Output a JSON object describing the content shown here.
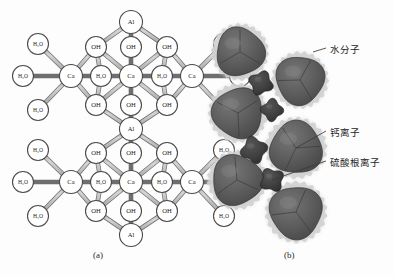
{
  "figure": {
    "background": "#fdfdfd",
    "panels": [
      {
        "id": "a",
        "caption": "(a)",
        "kind": "ball-and-stick-structure"
      },
      {
        "id": "b",
        "caption": "(b)",
        "kind": "space-filling-hydrated-ions"
      }
    ]
  },
  "panel_a": {
    "caption": "(a)",
    "node_colors": {
      "fill": "#ffffff",
      "stroke": "#4a4a4a",
      "bond": "#b9b9b9",
      "bond_edge": "#6e6e6e"
    },
    "node_labels": {
      "aluminium": "Al",
      "calcium": "Ca",
      "hydroxide": "OH",
      "water": "H₂O"
    },
    "nodes": [
      {
        "id": "al-top",
        "label": "Al",
        "x": 131,
        "y": 22,
        "r": 11.5
      },
      {
        "id": "oh-t-l",
        "label": "OH",
        "x": 96,
        "y": 47,
        "r": 10.5
      },
      {
        "id": "oh-t-c",
        "label": "OH",
        "x": 131,
        "y": 47,
        "r": 10.5
      },
      {
        "id": "oh-t-r",
        "label": "OH",
        "x": 167,
        "y": 47,
        "r": 10.5
      },
      {
        "id": "ca-l",
        "label": "Ca",
        "x": 71,
        "y": 76,
        "r": 11.5
      },
      {
        "id": "h2o-m-l",
        "label": "H₂O",
        "x": 101,
        "y": 76,
        "r": 10.5
      },
      {
        "id": "ca-c",
        "label": "Ca",
        "x": 131,
        "y": 76,
        "r": 11.5
      },
      {
        "id": "h2o-m-r",
        "label": "H₂O",
        "x": 162,
        "y": 76,
        "r": 10.5
      },
      {
        "id": "ca-r",
        "label": "Ca",
        "x": 192,
        "y": 76,
        "r": 11.5
      },
      {
        "id": "oh-b-l",
        "label": "OH",
        "x": 96,
        "y": 105,
        "r": 10.5
      },
      {
        "id": "oh-b-c",
        "label": "OH",
        "x": 131,
        "y": 105,
        "r": 10.5
      },
      {
        "id": "oh-b-r",
        "label": "OH",
        "x": 167,
        "y": 105,
        "r": 10.5
      },
      {
        "id": "al-mid",
        "label": "Al",
        "x": 131,
        "y": 129,
        "r": 11.5
      },
      {
        "id": "oh2-t-l",
        "label": "OH",
        "x": 96,
        "y": 153,
        "r": 10.5
      },
      {
        "id": "oh2-t-c",
        "label": "OH",
        "x": 131,
        "y": 153,
        "r": 10.5
      },
      {
        "id": "oh2-t-r",
        "label": "OH",
        "x": 167,
        "y": 153,
        "r": 10.5
      },
      {
        "id": "ca2-l",
        "label": "Ca",
        "x": 71,
        "y": 182,
        "r": 11.5
      },
      {
        "id": "h2o2-m-l",
        "label": "H₂O",
        "x": 101,
        "y": 182,
        "r": 10.5
      },
      {
        "id": "ca2-c",
        "label": "Ca",
        "x": 131,
        "y": 182,
        "r": 11.5
      },
      {
        "id": "h2o2-m-r",
        "label": "H₂O",
        "x": 162,
        "y": 182,
        "r": 10.5
      },
      {
        "id": "ca2-r",
        "label": "Ca",
        "x": 192,
        "y": 182,
        "r": 11.5
      },
      {
        "id": "oh2-b-l",
        "label": "OH",
        "x": 96,
        "y": 211,
        "r": 10.5
      },
      {
        "id": "oh2-b-c",
        "label": "OH",
        "x": 131,
        "y": 211,
        "r": 10.5
      },
      {
        "id": "oh2-b-r",
        "label": "OH",
        "x": 167,
        "y": 211,
        "r": 10.5
      },
      {
        "id": "al-bot",
        "label": "Al",
        "x": 131,
        "y": 235,
        "r": 11.5
      },
      {
        "id": "w-lt",
        "label": "H₂O",
        "x": 38,
        "y": 44,
        "r": 10.5
      },
      {
        "id": "w-lm",
        "label": "H₂O",
        "x": 23,
        "y": 76,
        "r": 10.5
      },
      {
        "id": "w-lb",
        "label": "H₂O",
        "x": 38,
        "y": 110,
        "r": 10.5
      },
      {
        "id": "w-rt",
        "label": "H₂O",
        "x": 224,
        "y": 44,
        "r": 10.5
      },
      {
        "id": "w-rm",
        "label": "H₂O",
        "x": 240,
        "y": 76,
        "r": 10.5
      },
      {
        "id": "w-rb",
        "label": "H₂O",
        "x": 224,
        "y": 110,
        "r": 10.5
      },
      {
        "id": "w2-lt",
        "label": "H₂O",
        "x": 38,
        "y": 150,
        "r": 10.5
      },
      {
        "id": "w2-lm",
        "label": "H₂O",
        "x": 23,
        "y": 182,
        "r": 10.5
      },
      {
        "id": "w2-lb",
        "label": "H₂O",
        "x": 38,
        "y": 216,
        "r": 10.5
      },
      {
        "id": "w2-rt",
        "label": "H₂O",
        "x": 224,
        "y": 150,
        "r": 10.5
      },
      {
        "id": "w2-rm",
        "label": "H₂O",
        "x": 240,
        "y": 182,
        "r": 10.5
      },
      {
        "id": "w2-rb",
        "label": "H₂O",
        "x": 224,
        "y": 216,
        "r": 10.5
      }
    ],
    "bonds": [
      [
        "al-top",
        "oh-t-l"
      ],
      [
        "al-top",
        "oh-t-c"
      ],
      [
        "al-top",
        "oh-t-r"
      ],
      [
        "oh-t-l",
        "ca-l"
      ],
      [
        "oh-t-l",
        "ca-c"
      ],
      [
        "oh-t-c",
        "ca-c"
      ],
      [
        "oh-t-r",
        "ca-c"
      ],
      [
        "oh-t-r",
        "ca-r"
      ],
      [
        "oh-t-l",
        "h2o-m-l"
      ],
      [
        "oh-t-r",
        "h2o-m-r"
      ],
      [
        "ca-l",
        "h2o-m-l"
      ],
      [
        "h2o-m-l",
        "ca-c"
      ],
      [
        "ca-c",
        "h2o-m-r"
      ],
      [
        "h2o-m-r",
        "ca-r"
      ],
      [
        "ca-l",
        "oh-b-l"
      ],
      [
        "oh-b-l",
        "ca-c"
      ],
      [
        "oh-b-c",
        "ca-c"
      ],
      [
        "oh-b-r",
        "ca-c"
      ],
      [
        "oh-b-r",
        "ca-r"
      ],
      [
        "oh-b-l",
        "h2o-m-l"
      ],
      [
        "oh-b-r",
        "h2o-m-r"
      ],
      [
        "oh-b-l",
        "al-mid"
      ],
      [
        "oh-b-c",
        "al-mid"
      ],
      [
        "oh-b-r",
        "al-mid"
      ],
      [
        "al-mid",
        "oh2-t-l"
      ],
      [
        "al-mid",
        "oh2-t-c"
      ],
      [
        "al-mid",
        "oh2-t-r"
      ],
      [
        "oh2-t-l",
        "ca2-l"
      ],
      [
        "oh2-t-l",
        "ca2-c"
      ],
      [
        "oh2-t-c",
        "ca2-c"
      ],
      [
        "oh2-t-r",
        "ca2-c"
      ],
      [
        "oh2-t-r",
        "ca2-r"
      ],
      [
        "oh2-t-l",
        "h2o2-m-l"
      ],
      [
        "oh2-t-r",
        "h2o2-m-r"
      ],
      [
        "ca2-l",
        "h2o2-m-l"
      ],
      [
        "h2o2-m-l",
        "ca2-c"
      ],
      [
        "ca2-c",
        "h2o2-m-r"
      ],
      [
        "h2o2-m-r",
        "ca2-r"
      ],
      [
        "ca2-l",
        "oh2-b-l"
      ],
      [
        "oh2-b-l",
        "ca2-c"
      ],
      [
        "oh2-b-c",
        "ca2-c"
      ],
      [
        "oh2-b-r",
        "ca2-c"
      ],
      [
        "oh2-b-r",
        "ca2-r"
      ],
      [
        "oh2-b-l",
        "h2o2-m-l"
      ],
      [
        "oh2-b-r",
        "h2o2-m-r"
      ],
      [
        "oh2-b-l",
        "al-bot"
      ],
      [
        "oh2-b-c",
        "al-bot"
      ],
      [
        "oh2-b-r",
        "al-bot"
      ],
      [
        "ca-l",
        "w-lt"
      ],
      [
        "ca-l",
        "w-lm"
      ],
      [
        "ca-l",
        "w-lb"
      ],
      [
        "ca-r",
        "w-rt"
      ],
      [
        "ca-r",
        "w-rm"
      ],
      [
        "ca-r",
        "w-rb"
      ],
      [
        "ca2-l",
        "w2-lt"
      ],
      [
        "ca2-l",
        "w2-lm"
      ],
      [
        "ca2-l",
        "w2-lb"
      ],
      [
        "ca2-r",
        "w2-rt"
      ],
      [
        "ca2-r",
        "w2-rm"
      ],
      [
        "ca2-r",
        "w2-rb"
      ]
    ]
  },
  "panel_b": {
    "caption": "(b)",
    "colors": {
      "core": "#5e5e5e",
      "core_dark": "#4d4d4d",
      "shell": "#c9c9c9",
      "halo": "#d8d8d8",
      "small_ion": "#3e3e3e",
      "leader": "#3a3a3a"
    },
    "big_spheres": [
      {
        "id": "ca-sphere-1",
        "x": 240,
        "y": 52,
        "r": 24
      },
      {
        "id": "ca-sphere-2",
        "x": 300,
        "y": 80,
        "r": 24
      },
      {
        "id": "ca-sphere-3",
        "x": 238,
        "y": 113,
        "r": 25
      },
      {
        "id": "ca-sphere-4",
        "x": 296,
        "y": 148,
        "r": 26
      },
      {
        "id": "ca-sphere-5",
        "x": 237,
        "y": 180,
        "r": 25
      },
      {
        "id": "ca-sphere-6",
        "x": 296,
        "y": 212,
        "r": 26
      }
    ],
    "small_ions": [
      {
        "id": "so4-ion-1",
        "x": 261,
        "y": 83,
        "r": 11
      },
      {
        "id": "so4-ion-2",
        "x": 272,
        "y": 110,
        "r": 10
      },
      {
        "id": "so4-ion-3",
        "x": 254,
        "y": 150,
        "r": 12
      },
      {
        "id": "so4-ion-4",
        "x": 272,
        "y": 180,
        "r": 11
      }
    ],
    "labels": [
      {
        "id": "label-water",
        "text": "水分子",
        "x": 330,
        "y": 42,
        "target_x": 313,
        "target_y": 52
      },
      {
        "id": "label-calcium",
        "text": "钙离子",
        "x": 330,
        "y": 125,
        "target_x": 296,
        "target_y": 148
      },
      {
        "id": "label-sulfate",
        "text": "硫酸根离子",
        "x": 330,
        "y": 155,
        "target_x": 272,
        "target_y": 180
      }
    ]
  }
}
